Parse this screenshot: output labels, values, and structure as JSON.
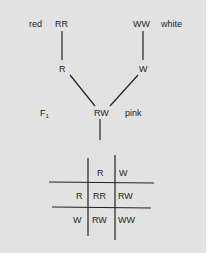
{
  "cross": {
    "parent_left": {
      "genotype": "RR",
      "phenotype": "red",
      "gamete": "R"
    },
    "parent_right": {
      "genotype": "WW",
      "phenotype": "white",
      "gamete": "W"
    },
    "f1": {
      "generation_label": "F",
      "generation_sub": "1",
      "genotype": "RW",
      "phenotype": "pink"
    }
  },
  "punnett": {
    "col_headers": [
      "R",
      "W"
    ],
    "row_headers": [
      "R",
      "W"
    ],
    "cells": [
      [
        "RR",
        "RW"
      ],
      [
        "RW",
        "WW"
      ]
    ]
  },
  "colors": {
    "background": "#e2e2e2",
    "ink": "#222222"
  }
}
